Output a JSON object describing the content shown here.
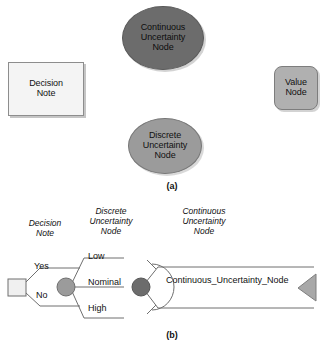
{
  "figure": {
    "panel_a_caption": "(a)",
    "panel_b_caption": "(b)"
  },
  "panel_a": {
    "nodes": [
      {
        "id": "decision-note",
        "shape": "rectangle",
        "fill": "#f4f4f4",
        "line1": "Decision",
        "line2": "Note"
      },
      {
        "id": "continuous-uncertainty-node",
        "shape": "ellipse",
        "fill": "#6c6c6c",
        "line1": "Continuous",
        "line2": "Uncertainty",
        "line3": "Node"
      },
      {
        "id": "discrete-uncertainty-node",
        "shape": "ellipse",
        "fill": "#9b9b9b",
        "line1": "Discrete",
        "line2": "Uncertainty",
        "line3": "Node"
      },
      {
        "id": "value-node",
        "shape": "rounded-rectangle",
        "fill": "#b0b0b0",
        "line1": "Value",
        "line2": "Node"
      }
    ]
  },
  "panel_b": {
    "column_headers": [
      {
        "id": "decision-note",
        "line1": "Decision",
        "line2": "Note"
      },
      {
        "id": "discrete-uncertainty-node",
        "line1": "Discrete",
        "line2": "Uncertainty",
        "line3": "Node"
      },
      {
        "id": "continuous-uncertainty-node",
        "line1": "Continuous",
        "line2": "Uncertainty",
        "line3": "Node"
      }
    ],
    "decision_branches": [
      "Yes",
      "No"
    ],
    "discrete_branches": [
      "Low",
      "Nominal",
      "High"
    ],
    "continuous_variable_label": "Continuous_Uncertainty_Node",
    "colors": {
      "discrete_chance_node": "#9b9b9b",
      "continuous_chance_node": "#6c6c6c",
      "decision_node": "#f0f0f0",
      "terminal_triangle": "#a8a8a8",
      "line": "#6f6f6f"
    }
  }
}
